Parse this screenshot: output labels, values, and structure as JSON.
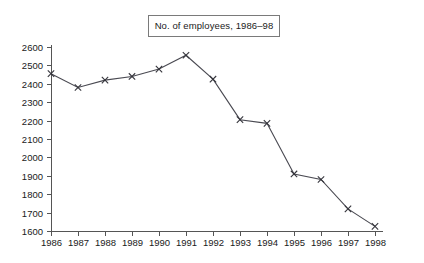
{
  "title": {
    "text": "No. of employees, 1986–98"
  },
  "chart_data": {
    "type": "line",
    "title": "No. of employees, 1986–98",
    "xlabel": "",
    "ylabel": "",
    "categories": [
      "1986",
      "1987",
      "1988",
      "1989",
      "1990",
      "1991",
      "1992",
      "1993",
      "1994",
      "1995",
      "1996",
      "1997",
      "1998"
    ],
    "x": [
      1986,
      1987,
      1988,
      1989,
      1990,
      1991,
      1992,
      1993,
      1994,
      1995,
      1996,
      1997,
      1998
    ],
    "values": [
      2455,
      2380,
      2420,
      2440,
      2480,
      2555,
      2425,
      2205,
      2185,
      1910,
      1880,
      1720,
      1625
    ],
    "series": [
      {
        "name": "No. of employees",
        "values": [
          2455,
          2380,
          2420,
          2440,
          2480,
          2555,
          2425,
          2205,
          2185,
          1910,
          1880,
          1720,
          1625
        ]
      }
    ],
    "ylim": [
      1600,
      2600
    ],
    "xlim": [
      1986,
      1998
    ],
    "ytick_labels": [
      "1600",
      "1700",
      "1800",
      "1900",
      "2000",
      "2100",
      "2200",
      "2300",
      "2400",
      "2500",
      "2600"
    ],
    "yticks": [
      1600,
      1700,
      1800,
      1900,
      2000,
      2100,
      2200,
      2300,
      2400,
      2500,
      2600
    ],
    "xtick_labels": [
      "1986",
      "1987",
      "1988",
      "1989",
      "1990",
      "1991",
      "1992",
      "1993",
      "1994",
      "1995",
      "1996",
      "1997",
      "1998"
    ],
    "grid": false,
    "legend": false,
    "marker": "x",
    "line_color": "#4a4a52",
    "marker_color": "#35353c",
    "axis_color": "#555555",
    "background": "#ffffff"
  },
  "geometry": {
    "plot_left": 51,
    "plot_right": 375,
    "plot_top": 47,
    "plot_bottom": 231,
    "x_step": 27,
    "y_unit_px": 0.184
  }
}
